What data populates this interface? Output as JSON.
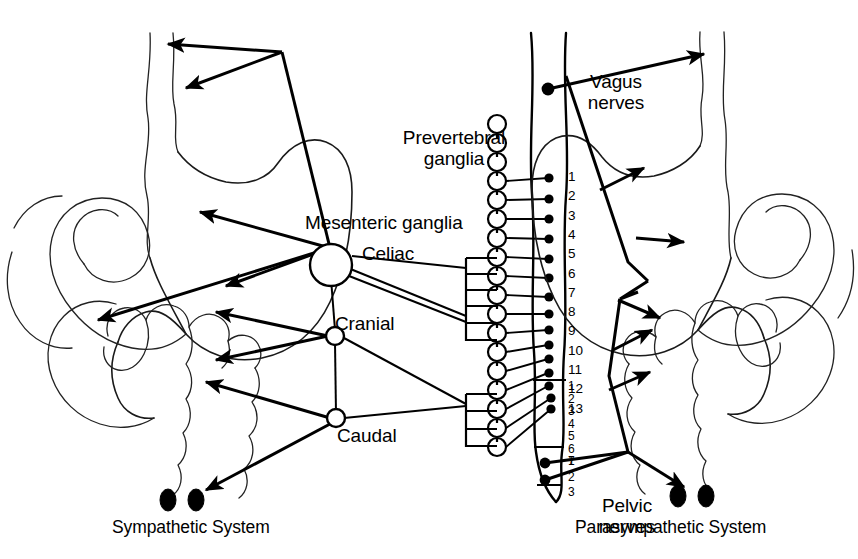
{
  "figure": {
    "background_color": "#ffffff",
    "line_color": "#000000"
  },
  "labels": {
    "prevertebral_ganglia": "Prevertebral\nganglia",
    "mesenteric_ganglia": "Mesenteric ganglia",
    "celiac": "Celiac",
    "cranial": "Cranial",
    "caudal": "Caudal",
    "vagus_nerves": "Vagus\nnerves",
    "pelvic_nerves": "Pelvic\nnerves",
    "sympathetic_system": "Sympathetic System",
    "parasympathetic_system": "Parasympathetic System"
  },
  "spinal_segments": {
    "thoracic": [
      "1",
      "2",
      "3",
      "4",
      "5",
      "6",
      "7",
      "8",
      "9",
      "10",
      "11",
      "12",
      "13"
    ],
    "lumbar": [
      "1",
      "2",
      "3",
      "4",
      "5",
      "6",
      "7"
    ],
    "sacral": [
      "1",
      "2",
      "3"
    ]
  },
  "systems": [
    {
      "name": "sympathetic",
      "side": "left",
      "label": "Sympathetic System",
      "ganglia": [
        {
          "name": "Celiac",
          "type": "mesenteric",
          "size": "large"
        },
        {
          "name": "Cranial",
          "type": "mesenteric",
          "size": "small"
        },
        {
          "name": "Caudal",
          "type": "mesenteric",
          "size": "small"
        }
      ],
      "chain": {
        "name": "Prevertebral ganglia",
        "count": 18,
        "shape": "open-circle"
      },
      "targets": [
        "esophagus",
        "stomach",
        "small intestine",
        "colon",
        "rectum"
      ]
    },
    {
      "name": "parasympathetic",
      "side": "right",
      "label": "Parasympathetic System",
      "nerves": [
        {
          "name": "Vagus nerves",
          "origin": "cranial",
          "targets": [
            "esophagus",
            "stomach",
            "small intestine",
            "colon"
          ]
        },
        {
          "name": "Pelvic nerves",
          "origin": "sacral 1-2",
          "targets": [
            "colon",
            "rectum"
          ]
        }
      ]
    }
  ],
  "organs": {
    "left": [
      "esophagus",
      "stomach",
      "small-intestine",
      "colon",
      "rectum"
    ],
    "right": [
      "esophagus",
      "stomach",
      "small-intestine",
      "colon",
      "rectum"
    ]
  }
}
